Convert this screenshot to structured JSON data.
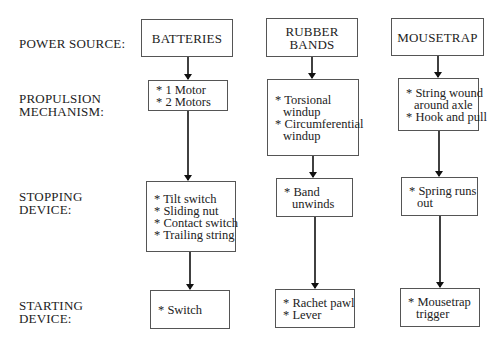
{
  "diagram": {
    "row_labels": [
      {
        "id": "power-source",
        "lines": [
          "POWER SOURCE:"
        ]
      },
      {
        "id": "propulsion-mechanism",
        "lines": [
          "PROPULSION",
          "MECHANISM:"
        ]
      },
      {
        "id": "stopping-device",
        "lines": [
          "STOPPING",
          "DEVICE:"
        ]
      },
      {
        "id": "starting-device",
        "lines": [
          "STARTING",
          "DEVICE:"
        ]
      }
    ],
    "columns": [
      {
        "power_source": [
          "BATTERIES"
        ],
        "propulsion": [
          [
            "* 1 Motor"
          ],
          [
            "* 2 Motors"
          ]
        ],
        "stopping": [
          [
            "* Tilt switch"
          ],
          [
            "* Sliding nut"
          ],
          [
            "* Contact switch"
          ],
          [
            "* Trailing string"
          ]
        ],
        "starting": [
          [
            "* Switch"
          ]
        ]
      },
      {
        "power_source": [
          "RUBBER",
          "BANDS"
        ],
        "propulsion": [
          [
            "* Torsional",
            "windup"
          ],
          [
            "* Circumferential",
            "windup"
          ]
        ],
        "stopping": [
          [
            "* Band",
            "unwinds"
          ]
        ],
        "starting": [
          [
            "* Rachet pawl"
          ],
          [
            "* Lever"
          ]
        ]
      },
      {
        "power_source": [
          "MOUSETRAP"
        ],
        "propulsion": [
          [
            "* String wound",
            "around axle"
          ],
          [
            "* Hook and pull"
          ]
        ],
        "stopping": [
          [
            "* Spring runs",
            "out"
          ]
        ],
        "starting": [
          [
            "* Mousetrap",
            "trigger"
          ]
        ]
      }
    ]
  }
}
